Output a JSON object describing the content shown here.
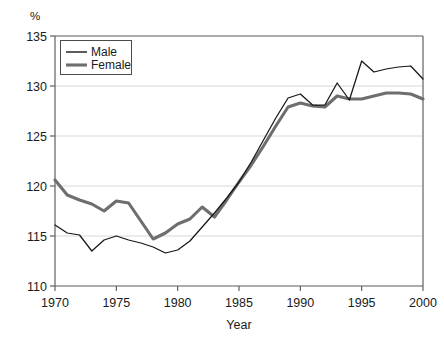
{
  "chart_data": {
    "type": "line",
    "title": "",
    "subtitle": "",
    "xlabel": "Year",
    "ylabel": "",
    "unit_label": "%",
    "xlim": [
      1970,
      2000
    ],
    "ylim": [
      110,
      135
    ],
    "xticks": [
      1970,
      1975,
      1980,
      1985,
      1990,
      1995,
      2000
    ],
    "yticks": [
      110,
      115,
      120,
      125,
      130,
      135
    ],
    "grid": "horizontal",
    "legend_position": "top-left",
    "x": [
      1970,
      1971,
      1972,
      1973,
      1974,
      1975,
      1976,
      1977,
      1978,
      1979,
      1980,
      1981,
      1982,
      1983,
      1984,
      1985,
      1986,
      1987,
      1988,
      1989,
      1990,
      1991,
      1992,
      1993,
      1994,
      1995,
      1996,
      1997,
      1998,
      1999,
      2000
    ],
    "series": [
      {
        "name": "Male",
        "color": "#161616",
        "values": [
          116.1,
          115.3,
          115.1,
          113.5,
          114.6,
          115.0,
          114.6,
          114.3,
          113.9,
          113.3,
          113.6,
          114.5,
          115.9,
          117.3,
          118.8,
          120.4,
          122.4,
          124.6,
          126.8,
          128.8,
          129.2,
          128.1,
          128.1,
          130.3,
          128.6,
          132.5,
          131.4,
          131.7,
          131.9,
          132.0,
          130.7
        ]
      },
      {
        "name": "Female",
        "color": "#6e6e6e",
        "values": [
          120.6,
          119.1,
          118.6,
          118.2,
          117.5,
          118.5,
          118.3,
          116.5,
          114.7,
          115.3,
          116.2,
          116.7,
          117.9,
          116.9,
          118.6,
          120.4,
          122.1,
          124.0,
          126.0,
          127.9,
          128.3,
          128.0,
          127.9,
          129.0,
          128.7,
          128.7,
          129.0,
          129.3,
          129.3,
          129.2,
          128.7
        ]
      }
    ]
  },
  "legend": {
    "items": [
      {
        "label": "Male"
      },
      {
        "label": "Female"
      }
    ]
  }
}
